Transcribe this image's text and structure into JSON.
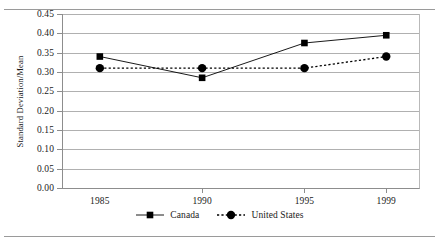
{
  "figure": {
    "yaxis_title": "Standard Deviation/Mean"
  },
  "legend": {
    "items": [
      {
        "label": "Canada",
        "marker": "square-marker",
        "line": "solid"
      },
      {
        "label": "United States",
        "marker": "circle-marker",
        "line": "dashed"
      }
    ]
  },
  "chart_data": {
    "type": "line",
    "title": "",
    "xlabel": "",
    "ylabel": "Standard Deviation/Mean",
    "x": [
      1985,
      1990,
      1995,
      1999
    ],
    "categories": [
      "1985",
      "1990",
      "1995",
      "1999"
    ],
    "xtick_labels": [
      "1985",
      "1990",
      "1995",
      "1999"
    ],
    "ytick_labels": [
      "0.45",
      "0.40",
      "0.35",
      "0.30",
      "0.25",
      "0.20",
      "0.15",
      "0.10",
      "0.05",
      "0.00"
    ],
    "ytick_values": [
      0.45,
      0.4,
      0.35,
      0.3,
      0.25,
      0.2,
      0.15,
      0.1,
      0.05,
      0.0
    ],
    "ylim": [
      0.0,
      0.45
    ],
    "xlim": [
      1983.2,
      2000.6
    ],
    "grid": true,
    "grid_axis": "y",
    "legend_position": "bottom-center",
    "series": [
      {
        "name": "Canada",
        "values": [
          0.34,
          0.285,
          0.375,
          0.395
        ],
        "marker": "square",
        "linestyle": "solid",
        "color": "#000000"
      },
      {
        "name": "United States",
        "values": [
          0.31,
          0.31,
          0.31,
          0.34
        ],
        "marker": "circle",
        "linestyle": "dashed",
        "color": "#000000"
      }
    ]
  }
}
